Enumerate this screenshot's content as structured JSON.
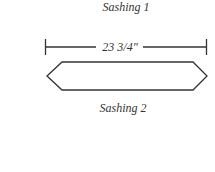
{
  "diagram": {
    "title_top": "Sashing 1",
    "dimension": "23 3/4\"",
    "title_bottom": "Sashing 2",
    "stroke_color": "#333333"
  }
}
